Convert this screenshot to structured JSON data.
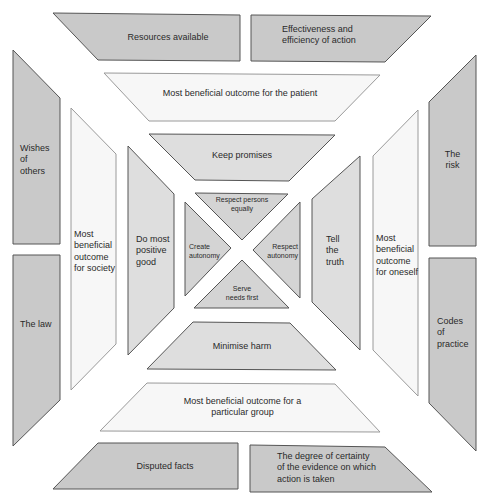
{
  "colors": {
    "dark_fill": "#c9c9c9",
    "mid_fill": "#dedede",
    "light_fill": "#f7f7f7",
    "stroke": "#555555",
    "light_stroke": "#9a9a9a"
  },
  "outer_ring": {
    "top_left": "Resources available",
    "top_right": "Effectiveness and\nefficiency of action",
    "left_top": "Wishes\nof\nothers",
    "left_bottom": "The law",
    "right_top": "The\nrisk",
    "right_bottom": "Codes\nof\npractice",
    "bottom_left": "Disputed facts",
    "bottom_right": "The degree of certainty\nof the evidence on which\naction is taken"
  },
  "outcome_ring": {
    "top": "Most beneficial outcome for the patient",
    "left": "Most\nbeneficial\noutcome\nfor society",
    "right": "Most\nbeneficial\noutcome\nfor oneself",
    "bottom": "Most beneficial outcome for a\nparticular group"
  },
  "duty_ring": {
    "top": "Keep promises",
    "left": "Do most\npositive\ngood",
    "right": "Tell\nthe\ntruth",
    "bottom": "Minimise harm"
  },
  "core": {
    "top": "Respect persons\nequally",
    "left": "Create\nautonomy",
    "right": "Respect\nautonomy",
    "bottom": "Serve\nneeds first"
  }
}
